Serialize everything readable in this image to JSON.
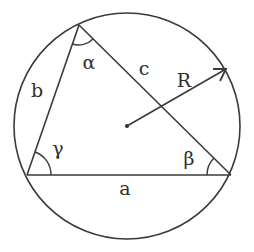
{
  "diagram": {
    "type": "circumscribed-triangle",
    "stroke_color": "#3a3a3a",
    "background": "#ffffff",
    "circle": {
      "cx": 127,
      "cy": 126,
      "r": 113
    },
    "vertices": {
      "top": {
        "x": 79,
        "y": 25
      },
      "bottom_left": {
        "x": 27,
        "y": 175
      },
      "bottom_right": {
        "x": 231,
        "y": 175
      }
    },
    "radius_arrow": {
      "from": {
        "x": 127,
        "y": 126
      },
      "to": {
        "x": 226,
        "y": 69
      }
    },
    "labels": {
      "side_a": "a",
      "side_b": "b",
      "side_c": "c",
      "radius": "R",
      "angle_alpha": "α",
      "angle_beta": "β",
      "angle_gamma": "γ"
    }
  }
}
